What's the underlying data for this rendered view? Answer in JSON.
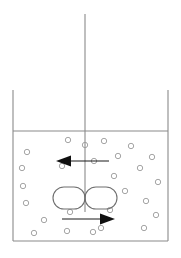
{
  "figure": {
    "canvas": {
      "width": 181,
      "height": 258
    },
    "colors": {
      "background": "#ffffff",
      "vessel_stroke": "#8a8a8a",
      "impeller_stroke": "#6f6f6f",
      "particle_stroke": "#9a9a9a",
      "arrow_fill": "#101010"
    }
  },
  "vessel": {
    "name": "open-top-tank",
    "left_wall_x": 13,
    "right_wall_x": 168,
    "wall_top_y": 90,
    "liquid_surface_y": 131,
    "bottom_y": 241
  },
  "shaft": {
    "name": "impeller-shaft",
    "x": 85,
    "top_y": 14,
    "bottom_y": 212
  },
  "impeller": {
    "name": "rushton-impeller",
    "center_x": 85,
    "center_y": 198,
    "blade_width": 32,
    "blade_height": 22,
    "blade_corner_radius": 11,
    "blade_count": 2
  },
  "flow_arrows": [
    {
      "name": "upper-circulation-arrow",
      "direction": "left",
      "tail_x": 109,
      "tip_x": 56,
      "y": 161
    },
    {
      "name": "lower-circulation-arrow",
      "direction": "right",
      "tail_x": 62,
      "tip_x": 115,
      "y": 219
    }
  ],
  "particles": {
    "name": "suspended-particles",
    "radius": 2.7,
    "count": 26,
    "positions": [
      [
        27,
        152
      ],
      [
        22,
        168
      ],
      [
        23,
        186
      ],
      [
        26,
        203
      ],
      [
        44,
        220
      ],
      [
        34,
        233
      ],
      [
        68,
        140
      ],
      [
        62,
        166
      ],
      [
        67,
        231
      ],
      [
        85,
        145
      ],
      [
        94,
        161
      ],
      [
        93,
        232
      ],
      [
        70,
        212
      ],
      [
        104,
        141
      ],
      [
        101,
        228
      ],
      [
        114,
        176
      ],
      [
        110,
        210
      ],
      [
        118,
        156
      ],
      [
        125,
        191
      ],
      [
        131,
        146
      ],
      [
        140,
        168
      ],
      [
        146,
        201
      ],
      [
        144,
        228
      ],
      [
        152,
        157
      ],
      [
        158,
        182
      ],
      [
        156,
        215
      ]
    ]
  }
}
